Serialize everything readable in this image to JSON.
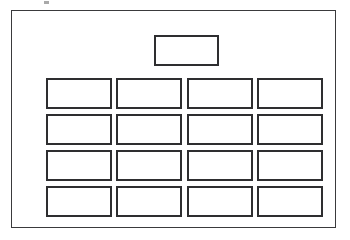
{
  "diagram": {
    "title": "",
    "background_color": "#ffffff",
    "line_color": "#2e2e30",
    "frame_color": "#3a3a3c",
    "artifact_label": "",
    "frame": {
      "label": ""
    },
    "header_box": {
      "label": ""
    },
    "grid": {
      "columns": 4,
      "rows": 4,
      "cells": [
        {
          "label": ""
        },
        {
          "label": ""
        },
        {
          "label": ""
        },
        {
          "label": ""
        },
        {
          "label": ""
        },
        {
          "label": ""
        },
        {
          "label": ""
        },
        {
          "label": ""
        },
        {
          "label": ""
        },
        {
          "label": ""
        },
        {
          "label": ""
        },
        {
          "label": ""
        },
        {
          "label": ""
        },
        {
          "label": ""
        },
        {
          "label": ""
        },
        {
          "label": ""
        }
      ]
    }
  }
}
